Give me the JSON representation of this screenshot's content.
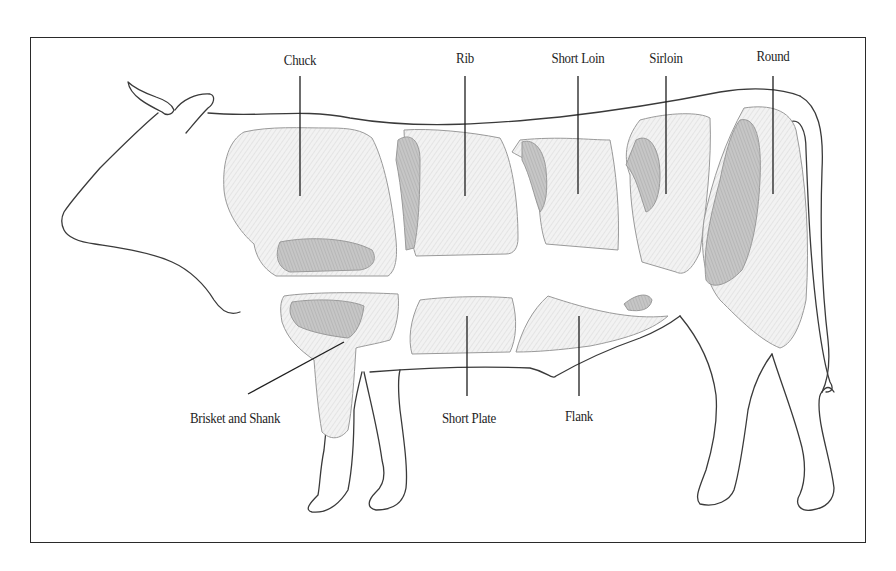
{
  "diagram": {
    "colors": {
      "outline": "#3a3a3a",
      "leader_line": "#1e1e1e",
      "cut_fill": "#eeeeee",
      "cut_shade": "#d4d4d4",
      "meat_fill": "#bdbdbd",
      "border": "#2a2a2a",
      "label_text": "#1e1e1e"
    },
    "top_labels": [
      {
        "id": "chuck",
        "text": "Chuck"
      },
      {
        "id": "rib",
        "text": "Rib"
      },
      {
        "id": "short-loin",
        "text": "Short Loin"
      },
      {
        "id": "sirloin",
        "text": "Sirloin"
      },
      {
        "id": "round",
        "text": "Round"
      }
    ],
    "bottom_labels": [
      {
        "id": "brisket-and-shank",
        "text": "Brisket and Shank"
      },
      {
        "id": "short-plate",
        "text": "Short Plate"
      },
      {
        "id": "flank",
        "text": "Flank"
      }
    ]
  }
}
